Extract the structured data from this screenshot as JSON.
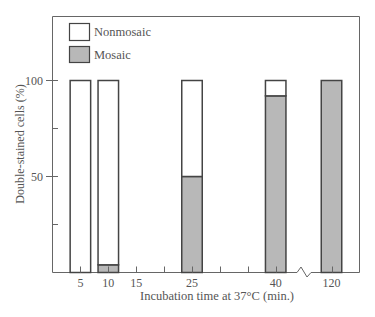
{
  "chart_data": {
    "type": "bar",
    "stacked": true,
    "title": "",
    "xlabel": "Incubation time at 37°C (min.)",
    "ylabel": "Double-stained cells (%)",
    "ylim": [
      0,
      100
    ],
    "yticks": [
      {
        "value": 50,
        "label": "50"
      },
      {
        "value": 100,
        "label": "100"
      }
    ],
    "yminor_ticks": [
      25,
      75
    ],
    "xticks": [
      {
        "value": 5,
        "label": "5"
      },
      {
        "value": 10,
        "label": "10"
      },
      {
        "value": 15,
        "label": "15"
      },
      {
        "value": 25,
        "label": "25"
      },
      {
        "value": 40,
        "label": "40"
      },
      {
        "value": 120,
        "label": "120"
      }
    ],
    "xminor_ticks": [
      20,
      30,
      35
    ],
    "axis_break": "between 40 and 120",
    "categories": [
      "5",
      "10",
      "25",
      "40",
      "120"
    ],
    "series": [
      {
        "name": "Mosaic",
        "color": "#b8b8b8",
        "values": [
          0,
          4,
          50,
          92,
          100
        ]
      },
      {
        "name": "Nonmosaic",
        "color": "#ffffff",
        "values": [
          100,
          96,
          50,
          8,
          0
        ]
      }
    ],
    "legend": {
      "position": "upper-left-inside",
      "entries": [
        {
          "label": "Nonmosaic",
          "color": "#ffffff"
        },
        {
          "label": "Mosaic",
          "color": "#b8b8b8"
        }
      ]
    },
    "grid": false
  },
  "colors": {
    "axis": "#555555",
    "mosaic": "#b8b8b8",
    "nonmosaic": "#ffffff"
  }
}
